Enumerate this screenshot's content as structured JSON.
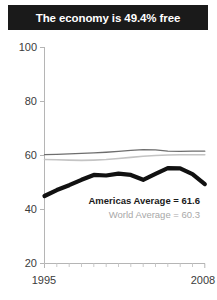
{
  "title": {
    "text": "The economy is 49.4% free"
  },
  "legend": {
    "americas_label": "Americas Average = 61.6",
    "world_label": "World Average = 60.3"
  },
  "axis": {
    "y_ticks": [
      "100",
      "80",
      "60",
      "40",
      "20"
    ],
    "x_start": "1995",
    "x_end": "2008"
  },
  "colors": {
    "banner_bg": "#1a1a1a",
    "banner_text": "#ffffff",
    "country_line": "#111111",
    "americas_line": "#6e6e6e",
    "world_line": "#c4c4c4",
    "axis": "#b5b5b5",
    "tick_text": "#3b3b3b"
  },
  "chart_data": {
    "type": "line",
    "title": "The economy is 49.4% free",
    "xlabel": "",
    "ylabel": "",
    "xlim": [
      1995,
      2008
    ],
    "ylim": [
      0,
      100
    ],
    "grid": false,
    "legend_position": "inside-lower-right",
    "x": [
      1995,
      1996,
      1997,
      1998,
      1999,
      2000,
      2001,
      2002,
      2003,
      2004,
      2005,
      2006,
      2007,
      2008
    ],
    "series": [
      {
        "name": "Country",
        "style": "thick-black",
        "values": [
          45.0,
          47.2,
          49.0,
          51.0,
          52.8,
          52.6,
          53.3,
          52.8,
          51.0,
          53.2,
          55.3,
          55.2,
          53.1,
          49.4
        ]
      },
      {
        "name": "Americas Average",
        "style": "thin-darkgray",
        "annotation_value": 61.6,
        "values": [
          60.3,
          60.4,
          60.6,
          60.8,
          61.0,
          61.2,
          61.5,
          61.9,
          62.2,
          62.1,
          61.6,
          61.5,
          61.6,
          61.6
        ]
      },
      {
        "name": "World Average",
        "style": "thin-lightgray",
        "annotation_value": 60.3,
        "values": [
          58.5,
          58.4,
          58.3,
          58.2,
          58.3,
          58.5,
          58.9,
          59.3,
          59.7,
          60.0,
          60.2,
          60.3,
          60.3,
          60.3
        ]
      }
    ]
  }
}
